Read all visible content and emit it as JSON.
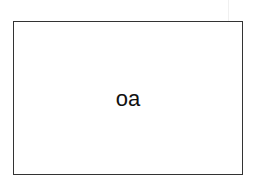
{
  "diagram": {
    "box": {
      "label": "oa",
      "border_color": "#333333",
      "fill_color": "#ffffff"
    }
  }
}
